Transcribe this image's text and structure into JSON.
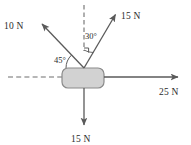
{
  "diagram": {
    "background_color": "#ffffff",
    "block": {
      "fill_color": "#d2d2d2",
      "stroke_color": "#8a8a8a",
      "x": 62,
      "y": 68,
      "width": 42,
      "height": 20,
      "corner_radius": 6
    },
    "origin": {
      "x": 84,
      "y": 68
    },
    "stroke_color": "#5a5a5a",
    "dashed_color": "#6e6e6e",
    "forces": [
      {
        "id": "force-up-left",
        "label": "10 N",
        "magnitude": 10,
        "unit": "N",
        "direction": "up-left",
        "tail": {
          "x": 84,
          "y": 68
        },
        "head": {
          "x": 40,
          "y": 22
        },
        "label_pos": {
          "x": 4,
          "y": 29
        }
      },
      {
        "id": "force-up-right",
        "label": "15 N",
        "magnitude": 15,
        "unit": "N",
        "direction": "up-right",
        "tail": {
          "x": 84,
          "y": 68
        },
        "head": {
          "x": 117,
          "y": 12
        },
        "label_pos": {
          "x": 121,
          "y": 19
        }
      },
      {
        "id": "force-right",
        "label": "25 N",
        "magnitude": 25,
        "unit": "N",
        "direction": "right",
        "tail": {
          "x": 104,
          "y": 77
        },
        "head": {
          "x": 181,
          "y": 77
        },
        "label_pos": {
          "x": 159,
          "y": 95
        }
      },
      {
        "id": "force-down",
        "label": "15 N",
        "magnitude": 15,
        "unit": "N",
        "direction": "down",
        "tail": {
          "x": 84,
          "y": 88
        },
        "head": {
          "x": 84,
          "y": 128
        },
        "label_pos": {
          "x": 71,
          "y": 142
        }
      }
    ],
    "angles": [
      {
        "id": "angle-45",
        "label": "45°",
        "value": 45,
        "unit": "degrees",
        "between": "block top edge and 10 N force",
        "label_pos": {
          "x": 56,
          "y": 62
        }
      },
      {
        "id": "angle-30",
        "label": "30°",
        "value": 30,
        "unit": "degrees",
        "between": "vertical dashed line and 15 N force",
        "label_pos": {
          "x": 85,
          "y": 39
        }
      }
    ],
    "reference_lines": [
      {
        "id": "dashed-horizontal",
        "orientation": "horizontal",
        "from": {
          "x": 8,
          "y": 77
        },
        "to": {
          "x": 62,
          "y": 77
        }
      },
      {
        "id": "dashed-vertical",
        "orientation": "vertical",
        "from": {
          "x": 84,
          "y": 5
        },
        "to": {
          "x": 84,
          "y": 51
        }
      }
    ]
  }
}
